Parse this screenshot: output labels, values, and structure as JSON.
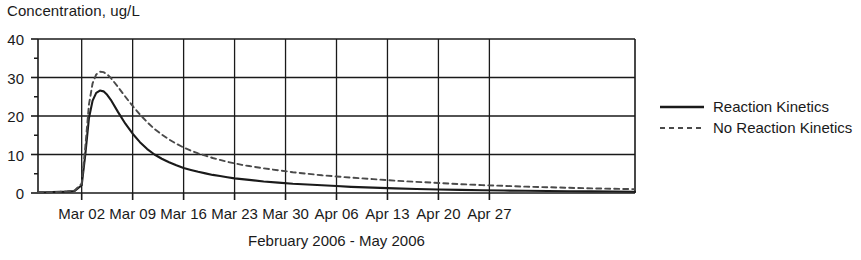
{
  "chart_data": {
    "type": "line",
    "title": "",
    "ylabel": "Concentration, ug/L",
    "xlabel": "February 2006 - May 2006",
    "ylim": [
      0,
      40
    ],
    "yticks": [
      0,
      10,
      20,
      30,
      40
    ],
    "yticklabels": [
      "0",
      "10",
      "20",
      "30",
      "40"
    ],
    "yminorticks": [
      5,
      15,
      25,
      35
    ],
    "xticklabels": [
      "Mar 02",
      "Mar 09",
      "Mar 16",
      "Mar 23",
      "Mar 30",
      "Apr 06",
      "Apr 13",
      "Apr 20",
      "Apr 27"
    ],
    "x_unit_days": 1,
    "xlim_days": [
      -6,
      76
    ],
    "grid": "both",
    "legend_position": "right",
    "series": [
      {
        "name": "Reaction Kinetics",
        "style": "solid",
        "color": "#1a1a1a",
        "x": [
          -6,
          -5,
          -4,
          -3,
          -2,
          -1,
          0,
          0.5,
          1,
          1.5,
          2,
          2.5,
          3,
          3.5,
          4,
          5,
          6,
          7,
          8,
          9,
          10,
          11,
          12,
          13,
          14,
          15,
          16,
          17,
          18,
          19,
          20,
          21,
          22,
          23,
          25,
          27,
          29,
          31,
          33,
          35,
          37,
          40,
          43,
          46,
          49,
          52,
          55,
          58,
          61,
          64,
          67,
          70,
          73,
          76
        ],
        "y": [
          0.2,
          0.2,
          0.25,
          0.3,
          0.35,
          0.5,
          2.0,
          10.0,
          19.5,
          24.0,
          26.0,
          26.6,
          26.4,
          25.5,
          24.2,
          21.0,
          18.0,
          15.4,
          13.2,
          11.4,
          10.0,
          8.9,
          8.0,
          7.2,
          6.5,
          6.0,
          5.5,
          5.1,
          4.7,
          4.4,
          4.1,
          3.8,
          3.6,
          3.4,
          3.0,
          2.7,
          2.4,
          2.2,
          2.0,
          1.8,
          1.6,
          1.4,
          1.2,
          1.05,
          0.92,
          0.8,
          0.72,
          0.64,
          0.57,
          0.51,
          0.46,
          0.42,
          0.38,
          0.34
        ]
      },
      {
        "name": "No Reaction Kinetics",
        "style": "dashed",
        "color": "#4a4a4a",
        "x": [
          -6,
          -5,
          -4,
          -3,
          -2,
          -1,
          0,
          0.5,
          1,
          1.5,
          2,
          2.5,
          3,
          3.5,
          4,
          5,
          6,
          7,
          8,
          9,
          10,
          11,
          12,
          13,
          14,
          15,
          16,
          17,
          18,
          19,
          20,
          21,
          22,
          23,
          25,
          27,
          29,
          31,
          33,
          35,
          37,
          40,
          43,
          46,
          49,
          52,
          55,
          58,
          61,
          64,
          67,
          70,
          73,
          76
        ],
        "y": [
          0.2,
          0.2,
          0.25,
          0.3,
          0.4,
          0.6,
          2.4,
          12.0,
          23.0,
          28.5,
          30.8,
          31.5,
          31.4,
          30.8,
          29.9,
          27.5,
          25.0,
          22.6,
          20.4,
          18.4,
          16.6,
          15.2,
          13.9,
          12.8,
          11.8,
          11.0,
          10.3,
          9.7,
          9.1,
          8.6,
          8.1,
          7.7,
          7.3,
          7.0,
          6.4,
          5.9,
          5.4,
          5.0,
          4.6,
          4.3,
          4.0,
          3.6,
          3.2,
          2.9,
          2.6,
          2.3,
          2.05,
          1.85,
          1.65,
          1.5,
          1.35,
          1.2,
          1.1,
          1.0
        ]
      }
    ]
  },
  "legend": {
    "items": [
      {
        "label": "Reaction Kinetics"
      },
      {
        "label": "No Reaction Kinetics"
      }
    ]
  }
}
